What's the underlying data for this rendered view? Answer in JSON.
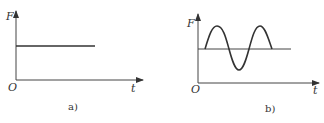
{
  "figure": {
    "panels": [
      {
        "id": "a",
        "caption": "a)",
        "y_axis_label": "F",
        "x_axis_label": "t",
        "origin_label": "O",
        "curve": "constant force (horizontal line)"
      },
      {
        "id": "b",
        "caption": "b)",
        "y_axis_label": "F",
        "x_axis_label": "t",
        "origin_label": "O",
        "curve": "sinusoidal oscillation around a constant mean level"
      }
    ],
    "colors": {
      "line": "#333333",
      "background": "#ffffff"
    }
  }
}
